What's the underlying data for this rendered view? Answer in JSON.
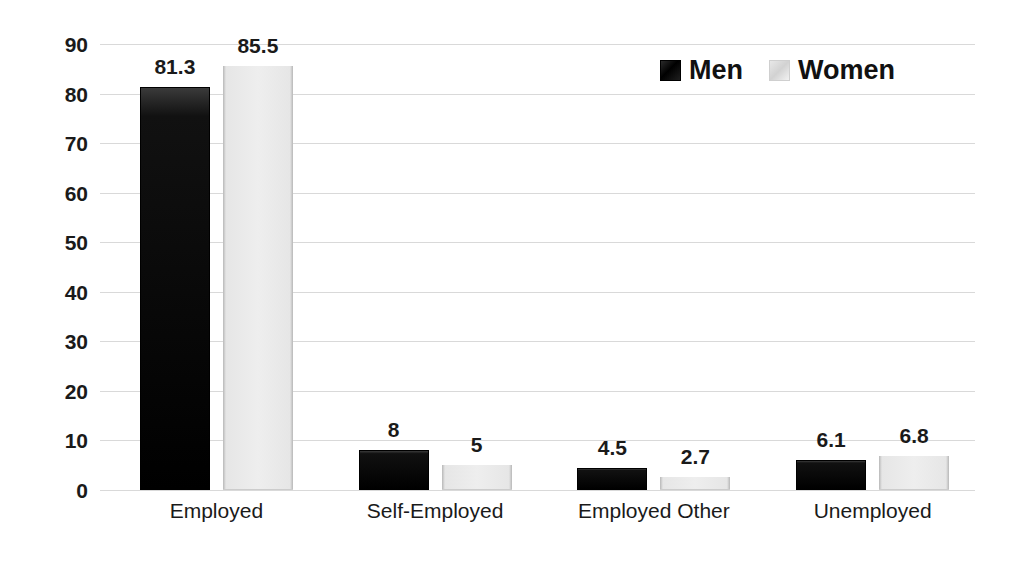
{
  "chart_data": {
    "type": "bar",
    "title": "",
    "subtitle": "",
    "xlabel": "",
    "ylabel": "",
    "ylim": [
      0,
      90
    ],
    "ytick_step": 10,
    "yticks": [
      90,
      80,
      70,
      60,
      50,
      40,
      30,
      20,
      10,
      0
    ],
    "ytick_labels": [
      "90",
      "80",
      "70",
      "60",
      "50",
      "40",
      "30",
      "20",
      "10",
      "0"
    ],
    "grid": true,
    "grid_axis": "y",
    "legend_position": "top-right",
    "categories": [
      "Employed",
      "Self-Employed",
      "Employed Other",
      "Unemployed"
    ],
    "series": [
      {
        "name": "Men",
        "color": "#000000",
        "values": [
          81.3,
          8,
          4.5,
          6.1
        ],
        "data_labels": [
          "81.3",
          "8",
          "4.5",
          "6.1"
        ]
      },
      {
        "name": "Women",
        "color": "#ededed",
        "values": [
          85.5,
          5,
          2.7,
          6.8
        ],
        "data_labels": [
          "85.5",
          "5",
          "2.7",
          "6.8"
        ]
      }
    ]
  },
  "legend": {
    "items": [
      {
        "label": "Men",
        "swatch": "men"
      },
      {
        "label": "Women",
        "swatch": "women"
      }
    ]
  },
  "colors": {
    "men_bar": "#000000",
    "women_bar": "#ededed",
    "gridline": "#d9d9d9",
    "text": "#1a1a1a",
    "background": "#ffffff"
  }
}
